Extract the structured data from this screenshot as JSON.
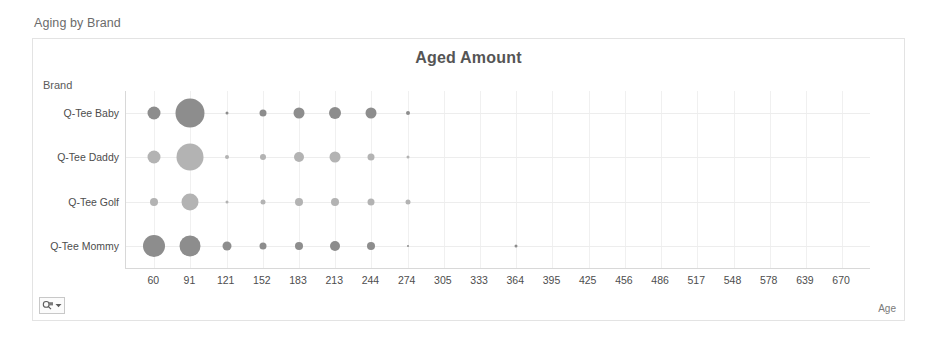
{
  "report": {
    "title": "Aging by Brand"
  },
  "chart_card": {
    "title": "Aged Amount",
    "y_axis_title": "Brand",
    "x_axis_title": "Age",
    "options_button": {
      "icon": "filter-magnifier-icon",
      "caret": "caret-down-icon"
    }
  },
  "colors": {
    "bubble": "#8d8d8d",
    "bubble_faded": "#b3b3b3",
    "grid": "#f0f0f0",
    "axis": "#d8d8d8",
    "card_border": "#e3e3e3",
    "title_text": "#555555",
    "label_text": "#4d4d4d",
    "report_title_text": "#6b6b6b"
  },
  "chart_data": {
    "type": "scatter",
    "title": "Aged Amount",
    "xlabel": "Age",
    "ylabel": "Brand",
    "grid": true,
    "legend": "none",
    "note": "Bubble (scatter) chart: bubble area encodes Aged Amount. Size values are relative diameters in px as rendered.",
    "categories": [
      "Q-Tee Baby",
      "Q-Tee Daddy",
      "Q-Tee Golf",
      "Q-Tee Mommy"
    ],
    "x": [
      60,
      91,
      121,
      152,
      183,
      213,
      244,
      274,
      305,
      333,
      364,
      395,
      425,
      456,
      486,
      517,
      548,
      578,
      639,
      670
    ],
    "series": [
      {
        "name": "Q-Tee Baby",
        "points": [
          {
            "x": 60,
            "size": 13
          },
          {
            "x": 91,
            "size": 29
          },
          {
            "x": 121,
            "size": 3
          },
          {
            "x": 152,
            "size": 7
          },
          {
            "x": 183,
            "size": 11
          },
          {
            "x": 213,
            "size": 12
          },
          {
            "x": 244,
            "size": 11
          },
          {
            "x": 274,
            "size": 4
          }
        ]
      },
      {
        "name": "Q-Tee Daddy",
        "points": [
          {
            "x": 60,
            "size": 13
          },
          {
            "x": 91,
            "size": 27
          },
          {
            "x": 121,
            "size": 4
          },
          {
            "x": 152,
            "size": 6
          },
          {
            "x": 183,
            "size": 10
          },
          {
            "x": 213,
            "size": 11
          },
          {
            "x": 244,
            "size": 7
          },
          {
            "x": 274,
            "size": 3
          }
        ]
      },
      {
        "name": "Q-Tee Golf",
        "points": [
          {
            "x": 60,
            "size": 8
          },
          {
            "x": 91,
            "size": 17
          },
          {
            "x": 121,
            "size": 3
          },
          {
            "x": 152,
            "size": 5
          },
          {
            "x": 183,
            "size": 8
          },
          {
            "x": 213,
            "size": 8
          },
          {
            "x": 244,
            "size": 7
          },
          {
            "x": 274,
            "size": 5
          }
        ]
      },
      {
        "name": "Q-Tee Mommy",
        "points": [
          {
            "x": 60,
            "size": 22
          },
          {
            "x": 91,
            "size": 21
          },
          {
            "x": 121,
            "size": 9
          },
          {
            "x": 152,
            "size": 7
          },
          {
            "x": 183,
            "size": 8
          },
          {
            "x": 213,
            "size": 10
          },
          {
            "x": 244,
            "size": 8
          },
          {
            "x": 274,
            "size": 2
          },
          {
            "x": 364,
            "size": 3
          }
        ]
      }
    ]
  }
}
